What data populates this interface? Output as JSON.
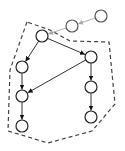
{
  "diagram": {
    "type": "directed-graph",
    "background": "#ffffff",
    "colors": {
      "edge": "#333333",
      "arrowhead": "#111111",
      "external_edge": "#b0b0b0",
      "external_arrowhead": "#a8a8a8",
      "node_stroke": "#222222",
      "external_node_stroke": "#555555",
      "node_fill": "#ffffff",
      "hull": "#444444"
    },
    "nodes": [
      {
        "id": "n1",
        "x": 101,
        "y": 16,
        "r": 6,
        "external": true
      },
      {
        "id": "n2",
        "x": 72,
        "y": 26,
        "r": 6,
        "external": true
      },
      {
        "id": "n3",
        "x": 42,
        "y": 36,
        "r": 6,
        "external": false
      },
      {
        "id": "n4",
        "x": 22,
        "y": 67,
        "r": 6,
        "external": false
      },
      {
        "id": "n5",
        "x": 91,
        "y": 57,
        "r": 6,
        "external": false
      },
      {
        "id": "n6",
        "x": 22,
        "y": 96,
        "r": 6,
        "external": false
      },
      {
        "id": "n7",
        "x": 91,
        "y": 87,
        "r": 6,
        "external": false
      },
      {
        "id": "n8",
        "x": 22,
        "y": 126,
        "r": 6,
        "external": false
      },
      {
        "id": "n9",
        "x": 91,
        "y": 117,
        "r": 6,
        "external": false
      }
    ],
    "edges": [
      {
        "from": "n1",
        "to": "n2",
        "external": true
      },
      {
        "from": "n2",
        "to": "n3",
        "external": true
      },
      {
        "from": "n3",
        "to": "n4",
        "external": false
      },
      {
        "from": "n3",
        "to": "n5",
        "external": false
      },
      {
        "from": "n4",
        "to": "n6",
        "external": false
      },
      {
        "from": "n5",
        "to": "n6",
        "external": false
      },
      {
        "from": "n5",
        "to": "n7",
        "external": false
      },
      {
        "from": "n6",
        "to": "n8",
        "external": false
      },
      {
        "from": "n7",
        "to": "n9",
        "external": false
      }
    ],
    "hull": {
      "style": "dashed",
      "points": [
        [
          27,
          22
        ],
        [
          10,
          70
        ],
        [
          8,
          131
        ],
        [
          48,
          143
        ],
        [
          92,
          131
        ],
        [
          115,
          104
        ],
        [
          109,
          42
        ],
        [
          70,
          41
        ],
        [
          50,
          30
        ]
      ]
    }
  }
}
